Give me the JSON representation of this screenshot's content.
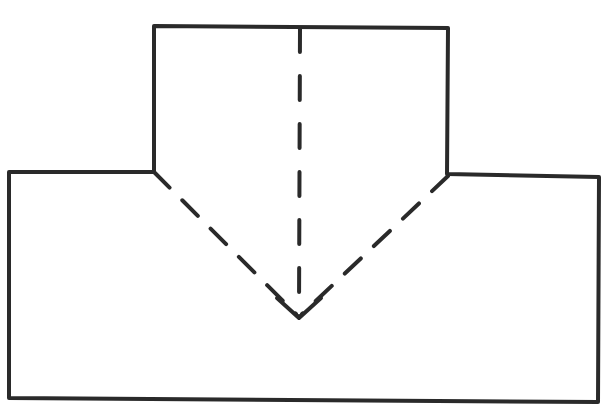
{
  "diagram": {
    "colors": {
      "stroke": "#2a2a2a",
      "background": "#ffffff"
    },
    "shapes": {
      "outline_points": "154,26 448,28 447,174 599,177 598,402 9,398 9,172 154,172 154,26",
      "left_diagonal": {
        "x1": 154,
        "y1": 172,
        "x2": 296,
        "y2": 314
      },
      "right_diagonal": {
        "x1": 448,
        "y1": 176,
        "x2": 302,
        "y2": 314
      },
      "center_line": {
        "x1": 300,
        "y1": 28,
        "x2": 299,
        "y2": 316
      },
      "arrowhead_points": "277,298 299,318 321,298"
    },
    "labels": []
  }
}
